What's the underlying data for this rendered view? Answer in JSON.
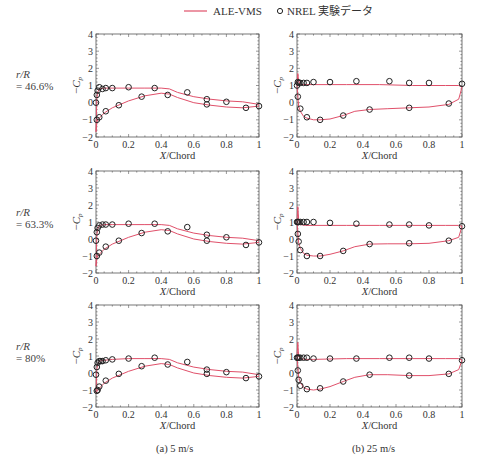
{
  "legend": {
    "line_label": "ALE-VMS",
    "marker_label": "NREL 実験データ",
    "line_color": "#e0506a",
    "marker_color": "#222222"
  },
  "row_labels": [
    {
      "line1": "r/R",
      "line2": "= 46.6%"
    },
    {
      "line1": "r/R",
      "line2": "= 63.3%"
    },
    {
      "line1": "r/R",
      "line2": "= 80%"
    }
  ],
  "captions": {
    "col_a": "(a) 5 m/s",
    "col_b": "(b) 25 m/s"
  },
  "axes": {
    "xlabel": "X/Chord",
    "ylabel": "−Cp",
    "xticks": [
      "0",
      "0.2",
      "0.4",
      "0.6",
      "0.8",
      "1"
    ],
    "yticks": [
      "−2",
      "−1",
      "0",
      "1",
      "2",
      "3",
      "4"
    ],
    "xlim": [
      0,
      1
    ],
    "ylim": [
      -2,
      4
    ]
  },
  "chart_data": [
    {
      "type": "line+scatter",
      "panel": "(a) 5 m/s, r/R = 46.6%",
      "xlabel": "X/Chord",
      "ylabel": "-Cp",
      "xlim": [
        0,
        1
      ],
      "ylim": [
        -2,
        4
      ],
      "series": [
        {
          "name": "ALE-VMS upper",
          "x": [
            0,
            0.005,
            0.01,
            0.02,
            0.05,
            0.1,
            0.2,
            0.3,
            0.4,
            0.45,
            0.5,
            0.6,
            0.7,
            0.8,
            0.9,
            1.0
          ],
          "y": [
            -1.7,
            0.2,
            0.6,
            0.8,
            0.85,
            0.85,
            0.85,
            0.85,
            0.85,
            0.8,
            0.6,
            0.35,
            0.2,
            0.1,
            0.05,
            -0.1
          ]
        },
        {
          "name": "ALE-VMS lower",
          "x": [
            0,
            0.005,
            0.01,
            0.02,
            0.05,
            0.1,
            0.2,
            0.3,
            0.4,
            0.45,
            0.5,
            0.6,
            0.7,
            0.8,
            0.9,
            1.0
          ],
          "y": [
            -1.7,
            -1.2,
            -1.0,
            -0.9,
            -0.6,
            -0.3,
            0.1,
            0.4,
            0.55,
            0.5,
            0.3,
            0.0,
            -0.15,
            -0.25,
            -0.3,
            -0.2
          ]
        },
        {
          "name": "NREL upper",
          "x": [
            0,
            0.005,
            0.01,
            0.02,
            0.04,
            0.06,
            0.1,
            0.2,
            0.36,
            0.56,
            0.68,
            0.8
          ],
          "y": [
            0.0,
            0.45,
            0.7,
            0.9,
            0.8,
            0.85,
            0.85,
            0.9,
            0.85,
            0.6,
            0.2,
            0.05
          ]
        },
        {
          "name": "NREL lower",
          "x": [
            0.005,
            0.02,
            0.06,
            0.14,
            0.28,
            0.44,
            0.68,
            0.92,
            1.0
          ],
          "y": [
            -1.0,
            -0.85,
            -0.5,
            -0.15,
            0.35,
            0.45,
            -0.1,
            -0.3,
            -0.2
          ]
        }
      ]
    },
    {
      "type": "line+scatter",
      "panel": "(b) 25 m/s, r/R = 46.6%",
      "xlabel": "X/Chord",
      "ylabel": "-Cp",
      "xlim": [
        0,
        1
      ],
      "ylim": [
        -2,
        4
      ],
      "series": [
        {
          "name": "ALE-VMS upper",
          "x": [
            0,
            0.005,
            0.01,
            0.02,
            0.05,
            0.1,
            0.3,
            0.5,
            0.7,
            0.9,
            0.98,
            1.0
          ],
          "y": [
            1.0,
            1.7,
            1.3,
            1.05,
            1.05,
            1.05,
            1.05,
            1.05,
            1.0,
            1.0,
            1.0,
            0.9
          ]
        },
        {
          "name": "ALE-VMS lower",
          "x": [
            0,
            0.01,
            0.02,
            0.04,
            0.06,
            0.1,
            0.14,
            0.2,
            0.28,
            0.35,
            0.44,
            0.55,
            0.68,
            0.8,
            0.92,
            0.98,
            1.0
          ],
          "y": [
            1.0,
            -0.2,
            -0.5,
            -0.8,
            -0.9,
            -1.0,
            -1.0,
            -0.95,
            -0.75,
            -0.5,
            -0.4,
            -0.35,
            -0.3,
            -0.25,
            -0.1,
            0.2,
            0.9
          ]
        },
        {
          "name": "NREL upper",
          "x": [
            0,
            0.005,
            0.01,
            0.02,
            0.04,
            0.06,
            0.1,
            0.2,
            0.36,
            0.56,
            0.68,
            0.8,
            1.0
          ],
          "y": [
            1.0,
            1.2,
            1.15,
            1.15,
            1.15,
            1.15,
            1.2,
            1.2,
            1.25,
            1.25,
            1.15,
            1.15,
            1.1
          ]
        },
        {
          "name": "NREL lower",
          "x": [
            0.005,
            0.02,
            0.06,
            0.14,
            0.28,
            0.44,
            0.68,
            0.92
          ],
          "y": [
            0.35,
            -0.35,
            -0.85,
            -1.0,
            -0.75,
            -0.4,
            -0.3,
            -0.05
          ]
        }
      ]
    },
    {
      "type": "line+scatter",
      "panel": "(a) 5 m/s, r/R = 63.3%",
      "xlabel": "X/Chord",
      "ylabel": "-Cp",
      "xlim": [
        0,
        1
      ],
      "ylim": [
        -2,
        4
      ],
      "series": [
        {
          "name": "ALE-VMS upper",
          "x": [
            0,
            0.005,
            0.01,
            0.02,
            0.05,
            0.1,
            0.2,
            0.3,
            0.4,
            0.45,
            0.5,
            0.6,
            0.7,
            0.8,
            0.9,
            1.0
          ],
          "y": [
            -1.6,
            0.2,
            0.6,
            0.8,
            0.85,
            0.85,
            0.85,
            0.85,
            0.85,
            0.8,
            0.6,
            0.35,
            0.2,
            0.1,
            0.05,
            -0.1
          ]
        },
        {
          "name": "ALE-VMS lower",
          "x": [
            0,
            0.005,
            0.01,
            0.02,
            0.05,
            0.1,
            0.2,
            0.3,
            0.4,
            0.45,
            0.5,
            0.6,
            0.7,
            0.8,
            0.9,
            1.0
          ],
          "y": [
            -1.6,
            -1.2,
            -1.0,
            -0.9,
            -0.6,
            -0.3,
            0.1,
            0.4,
            0.55,
            0.5,
            0.3,
            0.0,
            -0.15,
            -0.25,
            -0.3,
            -0.2
          ]
        },
        {
          "name": "NREL upper",
          "x": [
            0,
            0.005,
            0.01,
            0.02,
            0.04,
            0.06,
            0.1,
            0.2,
            0.36,
            0.56,
            0.68,
            0.8
          ],
          "y": [
            -0.1,
            0.4,
            0.65,
            0.8,
            0.85,
            0.85,
            0.85,
            0.9,
            0.9,
            0.7,
            0.25,
            0.1
          ]
        },
        {
          "name": "NREL lower",
          "x": [
            0.005,
            0.02,
            0.06,
            0.14,
            0.28,
            0.44,
            0.68,
            0.92,
            1.0
          ],
          "y": [
            -1.0,
            -0.8,
            -0.45,
            -0.1,
            0.35,
            0.45,
            -0.1,
            -0.35,
            -0.2
          ]
        }
      ]
    },
    {
      "type": "line+scatter",
      "panel": "(b) 25 m/s, r/R = 63.3%",
      "xlabel": "X/Chord",
      "ylabel": "-Cp",
      "xlim": [
        0,
        1
      ],
      "ylim": [
        -2,
        4
      ],
      "series": [
        {
          "name": "ALE-VMS upper",
          "x": [
            0,
            0.005,
            0.01,
            0.02,
            0.05,
            0.1,
            0.3,
            0.5,
            0.7,
            0.9,
            0.98,
            1.0
          ],
          "y": [
            1.0,
            1.9,
            1.2,
            0.85,
            0.8,
            0.8,
            0.8,
            0.8,
            0.8,
            0.8,
            0.8,
            0.75
          ]
        },
        {
          "name": "ALE-VMS lower",
          "x": [
            0,
            0.01,
            0.02,
            0.04,
            0.06,
            0.1,
            0.14,
            0.2,
            0.28,
            0.35,
            0.44,
            0.55,
            0.68,
            0.8,
            0.92,
            0.98,
            1.0
          ],
          "y": [
            1.0,
            -0.2,
            -0.55,
            -0.85,
            -0.95,
            -1.0,
            -1.0,
            -0.9,
            -0.7,
            -0.45,
            -0.3,
            -0.28,
            -0.28,
            -0.25,
            -0.1,
            0.1,
            0.75
          ]
        },
        {
          "name": "NREL upper",
          "x": [
            0,
            0.005,
            0.01,
            0.02,
            0.04,
            0.06,
            0.1,
            0.2,
            0.36,
            0.56,
            0.68,
            0.8,
            1.0
          ],
          "y": [
            1.0,
            1.0,
            1.0,
            1.0,
            1.0,
            1.0,
            1.0,
            0.95,
            0.9,
            0.85,
            0.85,
            0.8,
            0.75
          ]
        },
        {
          "name": "NREL lower",
          "x": [
            0.005,
            0.01,
            0.02,
            0.06,
            0.14,
            0.28,
            0.44,
            0.68,
            0.92
          ],
          "y": [
            0.3,
            -0.15,
            -0.65,
            -1.0,
            -1.0,
            -0.7,
            -0.3,
            -0.25,
            -0.1
          ]
        }
      ]
    },
    {
      "type": "line+scatter",
      "panel": "(a) 5 m/s, r/R = 80%",
      "xlabel": "X/Chord",
      "ylabel": "-Cp",
      "xlim": [
        0,
        1
      ],
      "ylim": [
        -2,
        4
      ],
      "series": [
        {
          "name": "ALE-VMS upper",
          "x": [
            0,
            0.005,
            0.01,
            0.02,
            0.05,
            0.1,
            0.2,
            0.3,
            0.4,
            0.45,
            0.5,
            0.6,
            0.7,
            0.8,
            0.9,
            1.0
          ],
          "y": [
            -1.2,
            0.2,
            0.5,
            0.7,
            0.75,
            0.8,
            0.85,
            0.85,
            0.85,
            0.8,
            0.6,
            0.35,
            0.2,
            0.1,
            0.05,
            -0.1
          ]
        },
        {
          "name": "ALE-VMS lower",
          "x": [
            0,
            0.005,
            0.01,
            0.02,
            0.05,
            0.1,
            0.2,
            0.3,
            0.4,
            0.45,
            0.5,
            0.6,
            0.7,
            0.8,
            0.9,
            1.0
          ],
          "y": [
            -1.2,
            -1.1,
            -1.0,
            -0.9,
            -0.6,
            -0.3,
            0.1,
            0.4,
            0.55,
            0.5,
            0.3,
            0.0,
            -0.15,
            -0.25,
            -0.3,
            -0.2
          ]
        },
        {
          "name": "NREL upper",
          "x": [
            0,
            0.005,
            0.01,
            0.02,
            0.03,
            0.04,
            0.06,
            0.1,
            0.2,
            0.36,
            0.56,
            0.68,
            0.8
          ],
          "y": [
            -0.1,
            0.35,
            0.6,
            0.7,
            0.7,
            0.7,
            0.75,
            0.8,
            0.85,
            0.9,
            0.65,
            0.2,
            0.05
          ]
        },
        {
          "name": "NREL lower",
          "x": [
            0.005,
            0.01,
            0.02,
            0.06,
            0.14,
            0.28,
            0.44,
            0.68,
            0.92,
            1.0
          ],
          "y": [
            -1.05,
            -1.0,
            -0.8,
            -0.45,
            -0.05,
            0.4,
            0.5,
            -0.05,
            -0.3,
            -0.2
          ]
        }
      ]
    },
    {
      "type": "line+scatter",
      "panel": "(b) 25 m/s, r/R = 80%",
      "xlabel": "X/Chord",
      "ylabel": "-Cp",
      "xlim": [
        0,
        1
      ],
      "ylim": [
        -2,
        4
      ],
      "series": [
        {
          "name": "ALE-VMS upper",
          "x": [
            0,
            0.005,
            0.01,
            0.02,
            0.05,
            0.1,
            0.3,
            0.5,
            0.7,
            0.9,
            0.98,
            1.0
          ],
          "y": [
            1.0,
            1.8,
            1.0,
            0.85,
            0.8,
            0.8,
            0.85,
            0.85,
            0.85,
            0.85,
            0.85,
            0.75
          ]
        },
        {
          "name": "ALE-VMS lower",
          "x": [
            0,
            0.01,
            0.02,
            0.04,
            0.06,
            0.1,
            0.14,
            0.2,
            0.28,
            0.35,
            0.44,
            0.55,
            0.68,
            0.8,
            0.92,
            0.98,
            1.0
          ],
          "y": [
            1.0,
            -0.2,
            -0.55,
            -0.85,
            -0.95,
            -1.0,
            -0.95,
            -0.8,
            -0.5,
            -0.25,
            -0.1,
            -0.1,
            -0.15,
            -0.15,
            -0.05,
            0.2,
            0.75
          ]
        },
        {
          "name": "NREL upper",
          "x": [
            0,
            0.005,
            0.01,
            0.02,
            0.04,
            0.06,
            0.1,
            0.2,
            0.36,
            0.56,
            0.68,
            0.8,
            1.0
          ],
          "y": [
            0.9,
            0.9,
            0.9,
            0.9,
            0.9,
            0.9,
            0.85,
            0.85,
            0.85,
            0.9,
            0.9,
            0.85,
            0.75
          ]
        },
        {
          "name": "NREL lower",
          "x": [
            0.005,
            0.01,
            0.02,
            0.06,
            0.14,
            0.28,
            0.44,
            0.68,
            0.92
          ],
          "y": [
            0.15,
            -0.4,
            -0.75,
            -0.95,
            -0.9,
            -0.5,
            -0.1,
            -0.15,
            -0.05
          ]
        }
      ]
    }
  ],
  "layout": {
    "panels": [
      {
        "left": 96,
        "top": 34,
        "width": 163,
        "height": 103
      },
      {
        "left": 297,
        "top": 34,
        "width": 165,
        "height": 103
      },
      {
        "left": 96,
        "top": 171,
        "width": 163,
        "height": 102
      },
      {
        "left": 297,
        "top": 171,
        "width": 165,
        "height": 102
      },
      {
        "left": 96,
        "top": 305,
        "width": 163,
        "height": 102
      },
      {
        "left": 297,
        "top": 305,
        "width": 165,
        "height": 102
      }
    ]
  }
}
